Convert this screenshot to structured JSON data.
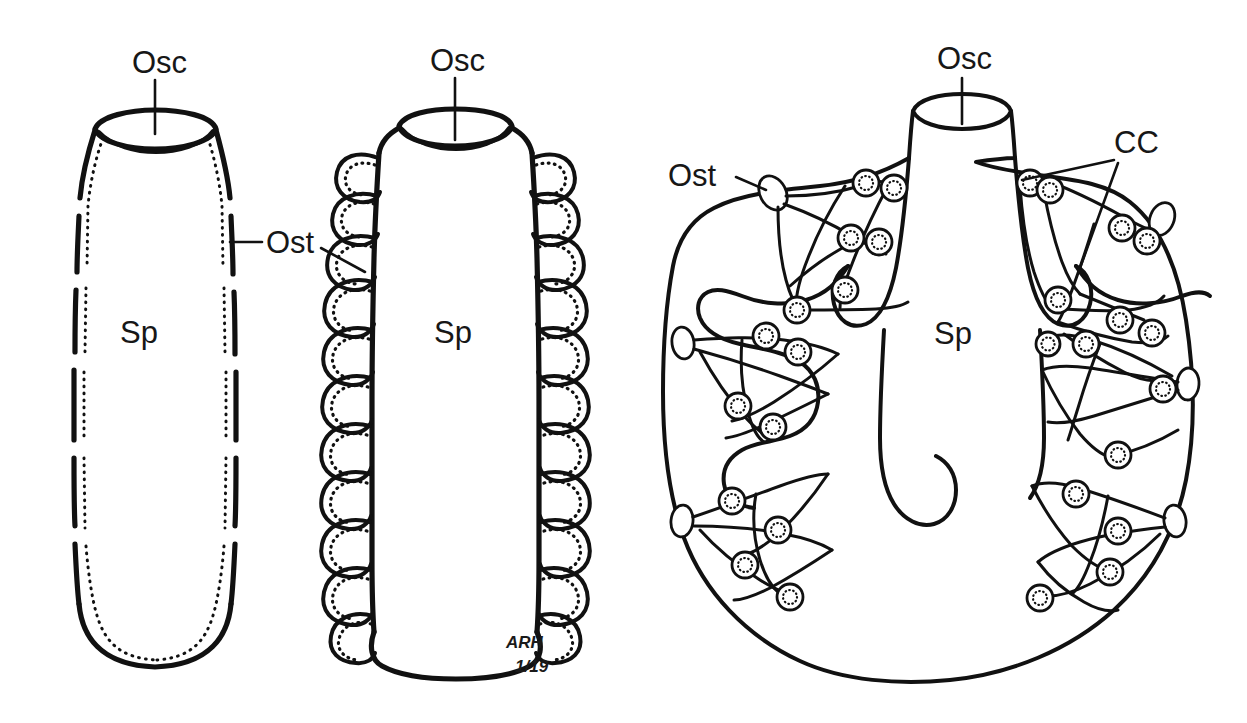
{
  "figure": {
    "background_color": "#ffffff",
    "ink_color": "#111111",
    "signature": {
      "initials": "ARH",
      "date": "1/19"
    }
  },
  "labels": {
    "osculum": "Osc",
    "ostium": "Ost",
    "spongocoel": "Sp",
    "choanocyte_chamber": "CC"
  },
  "panels": [
    {
      "id": "asconoid",
      "name": "asconoid-sponge",
      "osculum_label": "Osc",
      "spongocoel_label": "Sp",
      "ostium_label": "Ost",
      "wall_type": "simple dashed wall with stippled choanocyte lining"
    },
    {
      "id": "syconoid",
      "name": "syconoid-sponge",
      "osculum_label": "Osc",
      "spongocoel_label": "Sp",
      "ostium_label": "Ost",
      "wall_type": "folded radial canals lined with stippled choanocytes"
    },
    {
      "id": "leuconoid",
      "name": "leuconoid-sponge",
      "osculum_label": "Osc",
      "spongocoel_label": "Sp",
      "ostium_label": "Ost",
      "chamber_label": "CC",
      "wall_type": "branched canal systems with discrete choanocyte chambers",
      "canal_group_count": 6,
      "chamber_count": 26
    }
  ]
}
